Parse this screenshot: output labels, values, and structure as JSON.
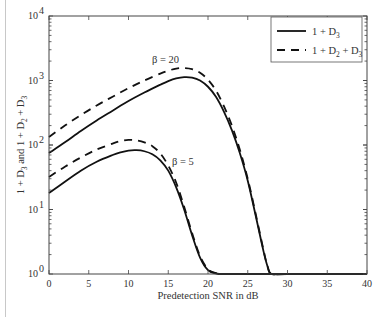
{
  "chart_data": {
    "type": "line",
    "title": "",
    "xlabel": "Predetection SNR in dB",
    "ylabel": "1 + D3 and 1 + D2 + D3",
    "ylabel_parts": {
      "a": "1 + D",
      "a_sub": "3",
      "b": " and 1 + D",
      "b_sub": "2",
      "c": " + D",
      "c_sub": "3"
    },
    "xlim": [
      0,
      40
    ],
    "ylim": [
      1,
      10000
    ],
    "yscale": "log",
    "xticks": [
      0,
      5,
      10,
      15,
      20,
      25,
      30,
      35,
      40
    ],
    "yticks": [
      {
        "base": "10",
        "exp": "0",
        "value": 1
      },
      {
        "base": "10",
        "exp": "1",
        "value": 10
      },
      {
        "base": "10",
        "exp": "2",
        "value": 100
      },
      {
        "base": "10",
        "exp": "3",
        "value": 1000
      },
      {
        "base": "10",
        "exp": "4",
        "value": 10000
      }
    ],
    "grid": false,
    "legend": {
      "position": "upper right",
      "entries": [
        {
          "label": "1 + D",
          "sub": "3",
          "tail": "",
          "style": "solid"
        },
        {
          "label": "1 + D",
          "sub": "2",
          "tail": " + D",
          "sub2": "3",
          "style": "dashed"
        }
      ]
    },
    "annotations": [
      {
        "text": "β = 20",
        "x": 17.2,
        "y": 1750
      },
      {
        "text": "β = 5",
        "x": 19.6,
        "y": 70
      }
    ],
    "series": [
      {
        "name": "1 + D3 (β = 20)",
        "style": "solid",
        "x": [
          0,
          2,
          4,
          6,
          8,
          10,
          12,
          14,
          15,
          16,
          17,
          18,
          19,
          20,
          21,
          22,
          23,
          24,
          25,
          26,
          27,
          27.5,
          28,
          30,
          40
        ],
        "y": [
          75,
          110,
          165,
          240,
          340,
          480,
          650,
          860,
          980,
          1080,
          1130,
          1110,
          1000,
          800,
          560,
          330,
          170,
          75,
          28,
          8,
          2.2,
          1.3,
          1.0,
          1,
          1
        ]
      },
      {
        "name": "1 + D2 + D3 (β = 20)",
        "style": "dashed",
        "x": [
          0,
          2,
          4,
          6,
          8,
          10,
          12,
          14,
          15,
          16,
          17,
          18,
          19,
          20,
          21,
          22,
          23,
          24,
          25,
          26,
          27,
          27.5,
          28,
          30,
          40
        ],
        "y": [
          133,
          200,
          290,
          410,
          560,
          760,
          1000,
          1280,
          1420,
          1530,
          1560,
          1500,
          1320,
          1030,
          700,
          400,
          200,
          85,
          30,
          8.5,
          2.3,
          1.3,
          1.0,
          1,
          1
        ]
      },
      {
        "name": "1 + D3 (β = 5)",
        "style": "solid",
        "x": [
          0,
          2,
          4,
          6,
          8,
          9,
          10,
          11,
          12,
          13,
          14,
          15,
          16,
          17,
          18,
          19,
          20,
          21,
          21.5,
          22,
          30,
          40
        ],
        "y": [
          18,
          27,
          40,
          55,
          70,
          77,
          82,
          83,
          80,
          72,
          58,
          40,
          22,
          10,
          4,
          1.8,
          1.15,
          1.02,
          1,
          1,
          1,
          1
        ]
      },
      {
        "name": "1 + D2 + D3 (β = 5)",
        "style": "dashed",
        "x": [
          0,
          2,
          4,
          6,
          8,
          9,
          10,
          11,
          12,
          13,
          14,
          15,
          16,
          17,
          18,
          19,
          20,
          21,
          21.5,
          22,
          30,
          40
        ],
        "y": [
          32,
          46,
          64,
          85,
          105,
          115,
          120,
          118,
          110,
          96,
          74,
          48,
          26,
          11,
          4.3,
          1.9,
          1.18,
          1.03,
          1,
          1,
          1,
          1
        ]
      }
    ]
  }
}
